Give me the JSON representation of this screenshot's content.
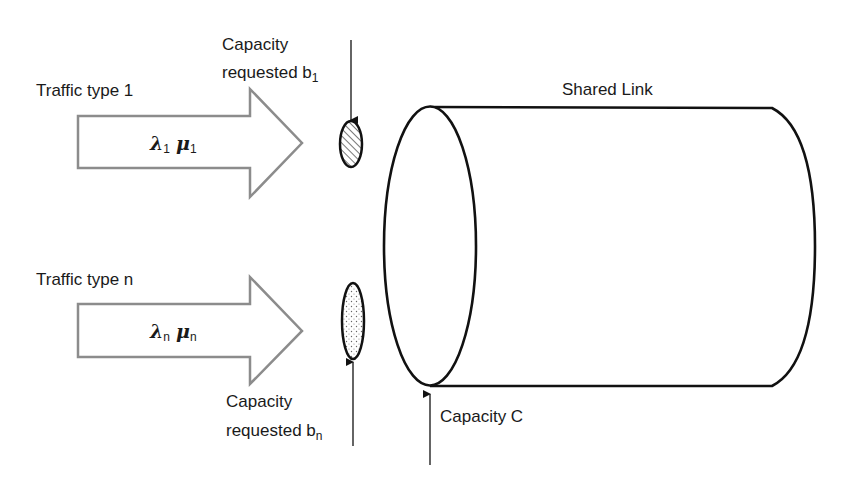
{
  "diagram": {
    "colors": {
      "background": "#ffffff",
      "stroke": "#111111",
      "arrow_stroke": "#8c8c8c",
      "text": "#1a1a1a"
    },
    "traffic_types": [
      {
        "label": "Traffic type 1",
        "lambda_symbol": "λ",
        "lambda_sub": "1",
        "mu_symbol": "μ",
        "mu_sub": "1",
        "capacity_label_line1": "Capacity",
        "capacity_label_line2": "requested b",
        "capacity_sub": "1",
        "fill_pattern": "hatched"
      },
      {
        "label": "Traffic type n",
        "lambda_symbol": "λ",
        "lambda_sub": "n",
        "mu_symbol": "μ",
        "mu_sub": "n",
        "capacity_label_line1": "Capacity",
        "capacity_label_line2": "requested b",
        "capacity_sub": "n",
        "fill_pattern": "dotted"
      }
    ],
    "link": {
      "label": "Shared Link",
      "capacity_label": "Capacity C"
    }
  }
}
